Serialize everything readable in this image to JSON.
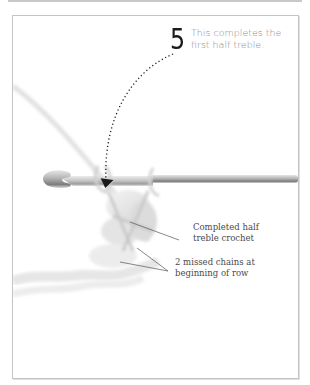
{
  "step": {
    "number": "5",
    "text": "This completes the first half treble."
  },
  "labels": {
    "completed": "Completed half treble crochet",
    "missed": "2 missed chains at beginning of row"
  },
  "illustration": {
    "subject": "crochet hook with yarn loops",
    "arrow": "dotted curved arrow pointing to hook"
  },
  "colors": {
    "frame_border": "#c4c4c4",
    "step_text": "#8a8a8a",
    "label_text": "#4a4a4a",
    "hook": "#8c8c8c"
  }
}
